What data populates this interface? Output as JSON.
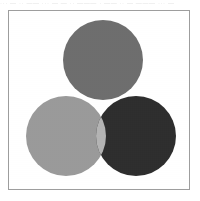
{
  "page": {
    "width": 200,
    "height": 201,
    "background": "#ffffff",
    "scan_artifact_text": "··· — ·· —— ··· — — ·· ——— · —— ·· — ——— ··· —"
  },
  "frame": {
    "border_color": "#9d9d9d",
    "fill": "#ffffff"
  },
  "chart_data": {
    "type": "venn",
    "title": "",
    "subtitle": "",
    "xlabel": "",
    "ylabel": "",
    "grid": false,
    "legend_position": "none",
    "set_count": 3,
    "radius": 40,
    "circles": [
      {
        "id": "top",
        "label": "",
        "cx": 94,
        "cy": 49,
        "r": 40,
        "color": "#6e6e6e"
      },
      {
        "id": "bottom-left",
        "label": "",
        "cx": 57,
        "cy": 125,
        "r": 40,
        "color": "#9a9a9a"
      },
      {
        "id": "bottom-right",
        "label": "",
        "cx": 127,
        "cy": 125,
        "r": 40,
        "color": "#2e2e2e"
      }
    ],
    "regions": [
      {
        "id": "top-only",
        "sets": [
          "top"
        ],
        "color": "#6e6e6e"
      },
      {
        "id": "bottom-left-only",
        "sets": [
          "bottom-left"
        ],
        "color": "#9a9a9a"
      },
      {
        "id": "bottom-right-only",
        "sets": [
          "bottom-right"
        ],
        "color": "#2e2e2e"
      },
      {
        "id": "top-bottomleft",
        "sets": [
          "top",
          "bottom-left"
        ],
        "color": "#f0f0f0"
      },
      {
        "id": "top-bottomright",
        "sets": [
          "top",
          "bottom-right"
        ],
        "color": "#4a4a4a"
      },
      {
        "id": "bottomleft-bottomright",
        "sets": [
          "bottom-left",
          "bottom-right"
        ],
        "color": "#b4b4b4"
      },
      {
        "id": "all-three",
        "sets": [
          "top",
          "bottom-left",
          "bottom-right"
        ],
        "color": "#ffffff"
      }
    ]
  }
}
